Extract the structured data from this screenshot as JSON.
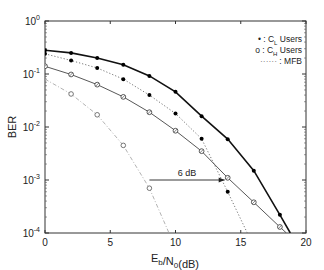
{
  "chart_data": {
    "type": "line",
    "title": "",
    "xlabel": "E_b/N_0(dB)",
    "ylabel": "BER",
    "xlim": [
      0,
      20
    ],
    "ylim": [
      0.0001,
      1
    ],
    "yscale": "log",
    "x_ticks": [
      "0",
      "5",
      "10",
      "15",
      "20"
    ],
    "y_ticks": [
      "10^0",
      "10^-1",
      "10^-2",
      "10^-3",
      "10^-4"
    ],
    "grid": false,
    "legend_position": "upper right",
    "legend": [
      {
        "marker": "•",
        "label_prefix": " : C",
        "subscript": "L",
        "label_suffix": " Users"
      },
      {
        "marker": "o",
        "label_prefix": " : C",
        "subscript": "H",
        "label_suffix": " Users"
      },
      {
        "marker": "······",
        "label_prefix": " : MFB",
        "subscript": "",
        "label_suffix": ""
      }
    ],
    "series": [
      {
        "name": "C_L Users (simulated, solid thick)",
        "style": "solid-thick",
        "marker": "filled",
        "x": [
          0,
          2,
          4,
          6,
          8,
          10,
          12,
          14,
          16,
          18,
          18.8
        ],
        "values": [
          0.28,
          0.25,
          0.2,
          0.15,
          0.092,
          0.046,
          0.016,
          0.0059,
          0.0015,
          0.00022,
          0.0001
        ]
      },
      {
        "name": "C_L Users MFB (dotted)",
        "style": "dotted",
        "marker": "filled",
        "x": [
          0,
          2,
          4,
          6,
          8,
          10,
          12,
          14,
          15.5
        ],
        "values": [
          0.24,
          0.18,
          0.13,
          0.08,
          0.04,
          0.018,
          0.006,
          0.0006,
          0.0001
        ]
      },
      {
        "name": "C_H Users (simulated, solid thin)",
        "style": "solid-thin",
        "marker": "circle-x",
        "x": [
          0,
          2,
          4,
          6,
          8,
          10,
          12,
          14,
          16,
          18,
          18.5
        ],
        "values": [
          0.14,
          0.098,
          0.063,
          0.037,
          0.019,
          0.0085,
          0.0035,
          0.0011,
          0.00038,
          0.00013,
          0.0001
        ]
      },
      {
        "name": "C_H Users MFB (dash-dot)",
        "style": "dashdot",
        "marker": "open-circle",
        "x": [
          0,
          2,
          4,
          6,
          8,
          9.5
        ],
        "values": [
          0.08,
          0.042,
          0.017,
          0.0045,
          0.0007,
          0.0001
        ]
      }
    ],
    "annotations": [
      {
        "text": "6 dB",
        "type": "arrow",
        "from": [
          8,
          0.001
        ],
        "to": [
          14,
          0.001
        ]
      }
    ]
  }
}
